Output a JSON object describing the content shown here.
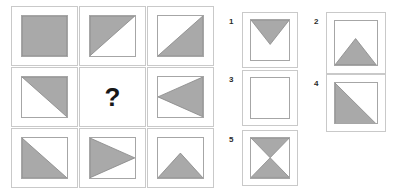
{
  "puzzle": {
    "title": "Matrix reasoning item",
    "missing_marker": "?",
    "fill_color": "#a9a9a9",
    "stroke_color": "#8a8a8a",
    "cell_border_color": "#c9c9c9",
    "inner_border_color": "#a6a6a6",
    "background_color": "#ffffff"
  },
  "matrix": {
    "rows": 3,
    "cols": 3,
    "cells": [
      {
        "index": 1,
        "row": 1,
        "col": 1,
        "shape": "full-square",
        "description": "fully shaded square"
      },
      {
        "index": 2,
        "row": 1,
        "col": 2,
        "shape": "triangle-upper-left",
        "description": "upper-left half shaded"
      },
      {
        "index": 3,
        "row": 1,
        "col": 3,
        "shape": "triangle-lower-right",
        "description": "lower-right half shaded"
      },
      {
        "index": 4,
        "row": 2,
        "col": 1,
        "shape": "triangle-upper-right",
        "description": "upper-right half shaded"
      },
      {
        "index": 5,
        "row": 2,
        "col": 2,
        "shape": "question-mark",
        "description": "missing element"
      },
      {
        "index": 6,
        "row": 2,
        "col": 3,
        "shape": "triangle-pointing-left",
        "description": "left-pointing triangle on right half"
      },
      {
        "index": 7,
        "row": 3,
        "col": 1,
        "shape": "triangle-lower-left",
        "description": "lower-left half shaded"
      },
      {
        "index": 8,
        "row": 3,
        "col": 2,
        "shape": "triangle-pointing-right",
        "description": "right-pointing triangle on left half"
      },
      {
        "index": 9,
        "row": 3,
        "col": 3,
        "shape": "triangle-pointing-up",
        "description": "up-pointing triangle on bottom half"
      }
    ]
  },
  "options": [
    {
      "label": "1",
      "shape": "triangle-pointing-down",
      "description": "down-pointing triangle on top half"
    },
    {
      "label": "2",
      "shape": "triangle-pointing-up",
      "description": "up-pointing triangle on bottom half"
    },
    {
      "label": "3",
      "shape": "empty-square",
      "description": "empty unshaded square"
    },
    {
      "label": "4",
      "shape": "triangle-lower-left",
      "description": "lower-left half shaded"
    },
    {
      "label": "5",
      "shape": "bowtie-vertical",
      "description": "hourglass: top down-triangle and bottom up-triangle"
    }
  ]
}
